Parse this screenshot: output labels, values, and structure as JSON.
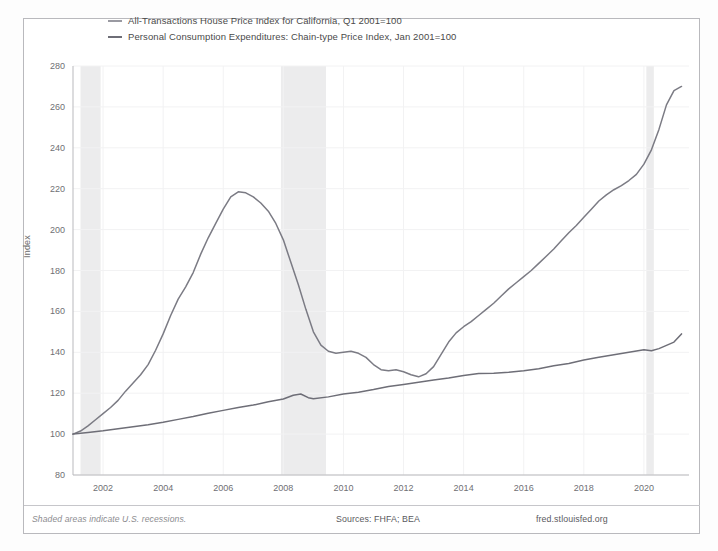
{
  "chart_data": {
    "type": "line",
    "title": "",
    "xlabel": "",
    "ylabel": "Index",
    "xlim": [
      2001.0,
      2021.5
    ],
    "ylim": [
      80,
      280
    ],
    "grid": true,
    "legend_position": "top-left",
    "x_ticks": [
      "2002",
      "2004",
      "2006",
      "2008",
      "2010",
      "2012",
      "2014",
      "2016",
      "2018",
      "2020"
    ],
    "y_ticks": [
      "80",
      "100",
      "120",
      "140",
      "160",
      "180",
      "200",
      "220",
      "240",
      "260",
      "280"
    ],
    "colors": {
      "hpi": "#7b7b84",
      "pce": "#6e6e77",
      "recession_band": "#ececed",
      "axis": "#b9b9bd",
      "grid": "#f2f2f3",
      "text": "#5a5a5e"
    },
    "annotations": {
      "recession_note": "Shaded areas indicate U.S. recessions.",
      "sources": "Sources: FHFA; BEA",
      "brand": "fred.stlouisfed.org"
    },
    "recessions": [
      {
        "start": 2001.25,
        "end": 2001.92
      },
      {
        "start": 2007.92,
        "end": 2009.42
      },
      {
        "start": 2020.08,
        "end": 2020.33
      }
    ],
    "series": [
      {
        "name": "All-Transactions House Price Index for California, Q1 2001=100",
        "key": "hpi",
        "color": "#7b7b84",
        "x": [
          2001.0,
          2001.25,
          2001.5,
          2001.75,
          2002.0,
          2002.25,
          2002.5,
          2002.75,
          2003.0,
          2003.25,
          2003.5,
          2003.75,
          2004.0,
          2004.25,
          2004.5,
          2004.75,
          2005.0,
          2005.25,
          2005.5,
          2005.75,
          2006.0,
          2006.25,
          2006.5,
          2006.75,
          2007.0,
          2007.25,
          2007.5,
          2007.75,
          2008.0,
          2008.25,
          2008.5,
          2008.75,
          2009.0,
          2009.25,
          2009.5,
          2009.75,
          2010.0,
          2010.25,
          2010.5,
          2010.75,
          2011.0,
          2011.25,
          2011.5,
          2011.75,
          2012.0,
          2012.25,
          2012.5,
          2012.75,
          2013.0,
          2013.25,
          2013.5,
          2013.75,
          2014.0,
          2014.25,
          2014.5,
          2014.75,
          2015.0,
          2015.25,
          2015.5,
          2015.75,
          2016.0,
          2016.25,
          2016.5,
          2016.75,
          2017.0,
          2017.25,
          2017.5,
          2017.75,
          2018.0,
          2018.25,
          2018.5,
          2018.75,
          2019.0,
          2019.25,
          2019.5,
          2019.75,
          2020.0,
          2020.25,
          2020.5,
          2020.75,
          2021.0,
          2021.25
        ],
        "y": [
          100.0,
          101.5,
          104.0,
          107.0,
          110.0,
          113.0,
          116.5,
          121.0,
          125.0,
          129.0,
          134.0,
          141.0,
          149.0,
          158.0,
          166.0,
          172.0,
          179.0,
          188.0,
          196.0,
          203.0,
          210.0,
          216.0,
          218.5,
          218.0,
          216.0,
          213.0,
          209.0,
          203.0,
          195.0,
          184.0,
          173.0,
          161.0,
          150.0,
          143.5,
          140.5,
          139.5,
          140.0,
          140.5,
          139.5,
          137.5,
          134.0,
          131.5,
          131.0,
          131.5,
          130.5,
          129.0,
          128.0,
          129.5,
          133.0,
          139.0,
          145.0,
          149.5,
          152.5,
          155.0,
          158.0,
          161.0,
          164.0,
          167.5,
          171.0,
          174.0,
          177.0,
          180.0,
          183.5,
          187.0,
          190.5,
          194.5,
          198.5,
          202.0,
          206.0,
          210.0,
          214.0,
          217.0,
          219.5,
          221.5,
          224.0,
          227.0,
          232.0,
          239.0,
          249.0,
          261.0,
          268.0,
          270.0
        ]
      },
      {
        "name": "Personal Consumption Expenditures: Chain-type Price Index, Jan 2001=100",
        "key": "pce",
        "color": "#6e6e77",
        "x": [
          2001.0,
          2001.5,
          2002.0,
          2002.5,
          2003.0,
          2003.5,
          2004.0,
          2004.5,
          2005.0,
          2005.5,
          2006.0,
          2006.5,
          2007.0,
          2007.5,
          2008.0,
          2008.33,
          2008.58,
          2008.83,
          2009.0,
          2009.5,
          2010.0,
          2010.5,
          2011.0,
          2011.5,
          2012.0,
          2012.5,
          2013.0,
          2013.5,
          2014.0,
          2014.5,
          2015.0,
          2015.5,
          2016.0,
          2016.5,
          2017.0,
          2017.5,
          2018.0,
          2018.5,
          2019.0,
          2019.5,
          2020.0,
          2020.25,
          2020.5,
          2021.0,
          2021.25
        ],
        "y": [
          100.0,
          100.8,
          101.6,
          102.6,
          103.6,
          104.6,
          105.8,
          107.2,
          108.6,
          110.2,
          111.6,
          113.0,
          114.2,
          115.8,
          117.2,
          119.0,
          119.6,
          117.8,
          117.3,
          118.2,
          119.6,
          120.5,
          121.8,
          123.3,
          124.3,
          125.3,
          126.4,
          127.4,
          128.6,
          129.6,
          129.8,
          130.3,
          131.0,
          132.0,
          133.4,
          134.5,
          136.2,
          137.6,
          138.8,
          140.0,
          141.2,
          140.8,
          141.8,
          145.0,
          149.0
        ]
      }
    ]
  },
  "legend": {
    "entries": [
      {
        "label": "All-Transactions House Price Index for California, Q1 2001=100",
        "color": "#9a9aa2"
      },
      {
        "label": "Personal Consumption Expenditures: Chain-type Price Index, Jan 2001=100",
        "color": "#6e6e77"
      }
    ]
  },
  "axes": {
    "y_title": "Index"
  },
  "footer": {
    "note": "Shaded areas indicate U.S. recessions.",
    "sources": "Sources: FHFA; BEA",
    "brand": "fred.stlouisfed.org"
  }
}
